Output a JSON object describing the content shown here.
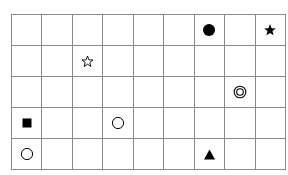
{
  "figure": {
    "type": "symbol-grid",
    "columns": 9,
    "rows": 5,
    "grid_line_color": "#8a8a8a",
    "background_color": "#ffffff",
    "symbol_color": "#000000",
    "symbol_names": {
      "filled_circle": "filled-circle-icon",
      "filled_star": "filled-star-icon",
      "open_star": "open-star-icon",
      "double_circle": "double-circle-icon",
      "filled_square": "filled-square-icon",
      "open_circle": "open-circle-icon",
      "filled_triangle": "filled-triangle-icon"
    },
    "cells": [
      [
        null,
        null,
        null,
        null,
        null,
        null,
        "filled_circle",
        null,
        "filled_star"
      ],
      [
        null,
        null,
        "open_star",
        null,
        null,
        null,
        null,
        null,
        null
      ],
      [
        null,
        null,
        null,
        null,
        null,
        null,
        null,
        "double_circle",
        null
      ],
      [
        "filled_square",
        null,
        null,
        "open_circle",
        null,
        null,
        null,
        null,
        null
      ],
      [
        "open_circle",
        null,
        null,
        null,
        null,
        null,
        "filled_triangle",
        null,
        null
      ]
    ]
  }
}
